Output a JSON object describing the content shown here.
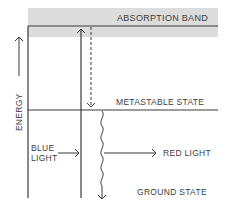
{
  "diagram": {
    "labels": {
      "absorption_band": "ABSORPTION BAND",
      "metastable_state": "METASTABLE STATE",
      "ground_state": "GROUND STATE",
      "energy_axis": "ENERGY",
      "blue_light_line1": "BLUE",
      "blue_light_line2": "LIGHT",
      "red_light": "RED LIGHT"
    },
    "colors": {
      "band_fill": "#dcdcdc",
      "line": "#3a3a3a",
      "background": "#ffffff"
    },
    "elements": {
      "absorption_band": "shaded band at top",
      "excitation_arrow": "solid upward arrow from ground to absorption band",
      "relaxation_arrow": "dashed downward arrow from absorption band to metastable state",
      "emission_arrow": "wavy downward arrow from metastable state to ground state",
      "energy_arrow": "upward arrow indicating increasing energy"
    }
  }
}
